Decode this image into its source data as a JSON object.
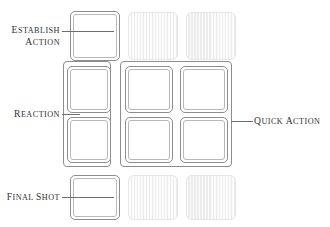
{
  "diagram": {
    "colors": {
      "active_border": "#8d8d8d",
      "active_inner_border": "#b8b8b8",
      "active_fill": "#ffffff",
      "inactive_fill": "#ececec",
      "inactive_border": "#e6e6e6",
      "leader_line": "#6e6e6e",
      "label_text": "#2f2f2f",
      "background": "#ffffff"
    },
    "grid": {
      "rows": 4,
      "columns": 3,
      "cell_states": [
        [
          "active",
          "inactive",
          "inactive"
        ],
        [
          "active",
          "active",
          "active"
        ],
        [
          "active",
          "active",
          "active"
        ],
        [
          "active",
          "inactive",
          "inactive"
        ]
      ]
    },
    "labels": [
      {
        "id": "establish-action",
        "line1": "Establish",
        "line2": "Action",
        "side": "left",
        "targets_row": 1,
        "targets_column": 1
      },
      {
        "id": "reaction",
        "line1": "Reaction",
        "line2": "",
        "side": "left",
        "targets_row": "2-3",
        "targets_column": 1
      },
      {
        "id": "final-shot",
        "line1": "Final Shot",
        "line2": "",
        "side": "left",
        "targets_row": 4,
        "targets_column": 1
      },
      {
        "id": "quick-action",
        "line1": "Quick Action",
        "line2": "",
        "side": "right",
        "targets_row": "2-3",
        "targets_column": "2-3"
      }
    ],
    "groups": [
      {
        "id": "reaction-group",
        "label_ref": "reaction",
        "rows": "2-3",
        "columns": "1"
      },
      {
        "id": "quick-action-group",
        "label_ref": "quick-action",
        "rows": "2-3",
        "columns": "2-3"
      }
    ]
  }
}
